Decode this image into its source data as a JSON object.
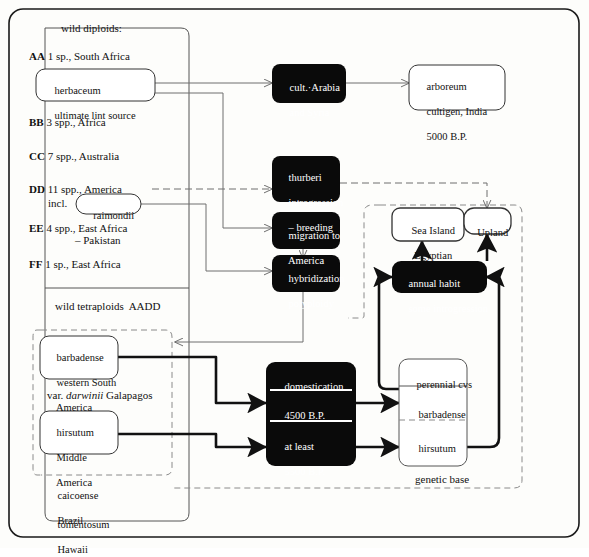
{
  "figure": {
    "type": "diagram",
    "background": "#fdfdfb",
    "line_color": "#6e6e6e",
    "bold_line_color": "#111111",
    "black_box_fill": "#0a0a0a",
    "white_box_fill": "#ffffff"
  },
  "sections": {
    "wild_diploids_title": "wild diploids:",
    "wild_tetraploids_title": "wild tetraploids  AADD",
    "genetic_base_title": "genetic base"
  },
  "genomes": [
    {
      "code": "AA",
      "text": "1 sp., South Africa"
    },
    {
      "code": "BB",
      "text": "3 spp., Africa"
    },
    {
      "code": "CC",
      "text": "7 spp., Australia"
    },
    {
      "code": "DD",
      "text": "11 spp., America"
    },
    {
      "code": "EE",
      "text": "4 spp., East Africa"
    },
    {
      "code": "EE2",
      "text": "– Pakistan"
    },
    {
      "code": "FF",
      "text": "1 sp., East Africa"
    }
  ],
  "labels": {
    "incl": "incl.",
    "var_darwinii": "var. darwinii Galapagos",
    "var_darwinii_prefix": "var. ",
    "var_darwinii_italic": "darwinii",
    "var_darwinii_suffix": " Galapagos"
  },
  "boxes": {
    "herbaceum": {
      "line1": "herbaceum",
      "line2": "ultimate lint source",
      "style": "white-rounded"
    },
    "raimondii": {
      "line1": "raimondii",
      "style": "white-rounded"
    },
    "cult_arabia": {
      "line1": "cult.·Arabia",
      "line2": "and Syria",
      "style": "black-rounded"
    },
    "arboreum": {
      "line1": "arboreum",
      "line2": "cultigen, India",
      "line3": "5000 B.P.",
      "style": "white-rounded"
    },
    "thurberi": {
      "line1": "thurberi",
      "line2": "introgression",
      "line3": "– breeding",
      "style": "black-rounded"
    },
    "migration": {
      "line1": "migration to",
      "line2": "America",
      "style": "black-rounded"
    },
    "hybridization": {
      "line1": "hybridization",
      "line2": "polyploidy",
      "style": "black-rounded"
    },
    "sea_island": {
      "line1": "Sea Island",
      "line2": "Egyptian",
      "style": "white-rounded"
    },
    "upland": {
      "line1": "Upland",
      "style": "white-rounded"
    },
    "annual_habit": {
      "line1": "annual habit",
      "line2": "some introgression",
      "style": "black-rounded"
    },
    "barbadense_wild": {
      "line1": "barbadense",
      "line2": "western South",
      "line3": "America",
      "style": "white-rounded"
    },
    "hirsutum_wild": {
      "line1": "hirsutum",
      "line2": "Middle",
      "line3": "America",
      "style": "white-rounded"
    },
    "caicoense": {
      "line1": "caicoense",
      "line2": "Brazil",
      "style": "plain"
    },
    "tomentosum": {
      "line1": "tomentosum",
      "line2": "Hawaii",
      "style": "plain"
    },
    "domestication": {
      "header": "domestication",
      "row1": "4500 B.P.",
      "row2_line1": "at least",
      "row2_line2": "5500 B.P.",
      "style": "black-rounded-split"
    },
    "perennial_cvs": {
      "header": "perennial cvs",
      "row1": "barbadense",
      "row2": "hirsutum",
      "style": "white-rounded-split"
    }
  }
}
